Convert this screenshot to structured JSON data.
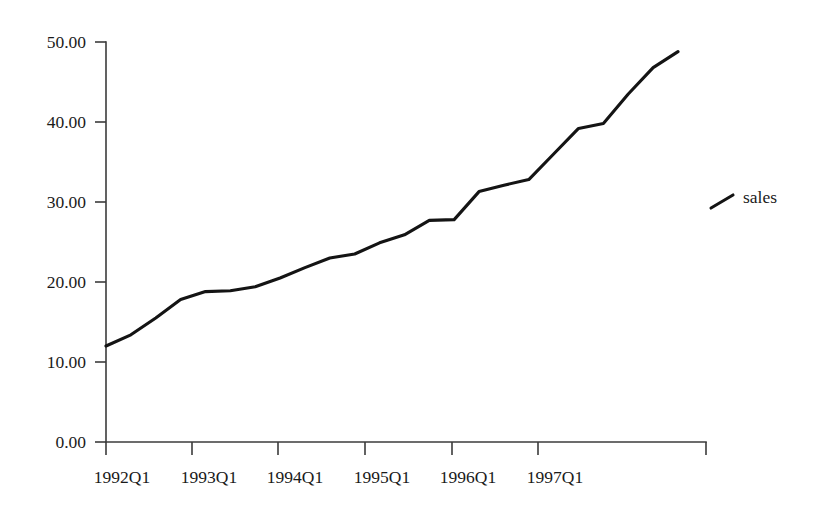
{
  "chart_data": {
    "type": "line",
    "title": "",
    "subtitle": "",
    "xlabel": "",
    "ylabel": "",
    "grid": false,
    "legend_position": "right",
    "ylim": [
      0,
      50
    ],
    "y_ticks": [
      0,
      10,
      20,
      30,
      40,
      50
    ],
    "y_tick_labels": [
      "0.00",
      "10.00",
      "20.00",
      "30.00",
      "40.00",
      "50.00"
    ],
    "x_tick_labels": [
      "1992Q1",
      "1993Q1",
      "1994Q1",
      "1995Q1",
      "1996Q1",
      "1997Q1"
    ],
    "x_tick_values": [
      "1992Q1",
      "1993Q1",
      "1994Q1",
      "1995Q1",
      "1996Q1",
      "1997Q1"
    ],
    "x": [
      "1992Q1",
      "1992Q2",
      "1992Q3",
      "1992Q4",
      "1993Q1",
      "1993Q2",
      "1993Q3",
      "1993Q4",
      "1994Q1",
      "1994Q2",
      "1994Q3",
      "1994Q4",
      "1995Q1",
      "1995Q2",
      "1995Q3",
      "1995Q4",
      "1996Q1",
      "1996Q2",
      "1996Q3",
      "1996Q4",
      "1997Q1",
      "1997Q2",
      "1997Q3"
    ],
    "series": [
      {
        "name": "sales",
        "color": "#141414",
        "values": [
          12.0,
          13.4,
          15.5,
          17.8,
          18.8,
          18.9,
          19.4,
          20.5,
          21.8,
          23.0,
          23.5,
          24.9,
          25.9,
          27.7,
          27.8,
          31.3,
          32.1,
          32.8,
          36.0,
          39.2,
          39.8,
          43.5,
          46.8
        ]
      }
    ],
    "legend": [
      {
        "label": "sales",
        "color": "#141414",
        "marker": "line-segment"
      }
    ],
    "end_plateau_value": 48.8,
    "axis_color": "#3b3b3b"
  },
  "legend": {
    "series_label": "sales"
  }
}
